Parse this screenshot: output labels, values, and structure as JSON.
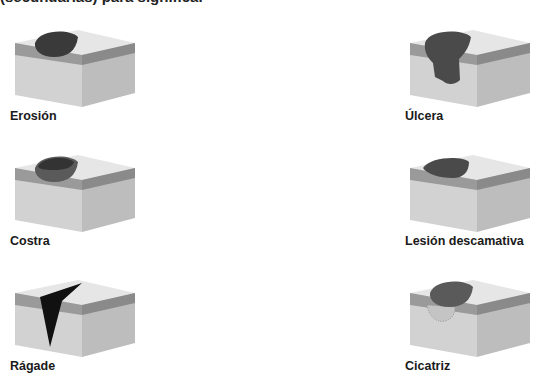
{
  "heading": "(secundarias) para significar",
  "items": [
    {
      "label": "Erosión",
      "type": "erosion"
    },
    {
      "label": "Úlcera",
      "type": "ulcer"
    },
    {
      "label": "Costra",
      "type": "crust"
    },
    {
      "label": "Lesión descamativa",
      "type": "scale"
    },
    {
      "label": "Rágade",
      "type": "fissure"
    },
    {
      "label": "Cicatriz",
      "type": "scar"
    }
  ],
  "colors": {
    "top_surface": "#e6e6e6",
    "epidermis": "#8e8e8e",
    "dermis": "#cfcfcf",
    "side_shade": "#b9b9b9",
    "lesion_dark": "#3a3a3a",
    "fissure": "#111111"
  }
}
